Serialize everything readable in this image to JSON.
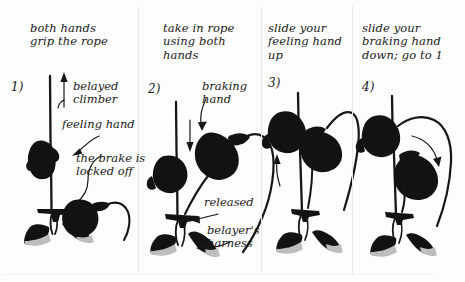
{
  "figure": {
    "background_color": "#fdfdfd",
    "ink_color": "#121212",
    "shadow_color": "#bdbdbd",
    "panel_count": 4
  },
  "panels": [
    {
      "number": "1)",
      "heading": "both hands\ngrip the rope",
      "labels": [
        {
          "text": "belayed\nclimber"
        },
        {
          "text": "feeling hand"
        },
        {
          "text": "the brake is\nlocked off"
        }
      ]
    },
    {
      "number": "2)",
      "heading": "take in rope\nusing both\nhands",
      "labels": [
        {
          "text": "braking\nhand"
        },
        {
          "text": "released"
        },
        {
          "text": "belayer's\nharness"
        }
      ]
    },
    {
      "number": "3)",
      "heading": "slide your\nfeeling hand\nup",
      "labels": []
    },
    {
      "number": "4)",
      "heading": "slide your\nbraking hand\ndown; go to 1",
      "labels": []
    }
  ]
}
